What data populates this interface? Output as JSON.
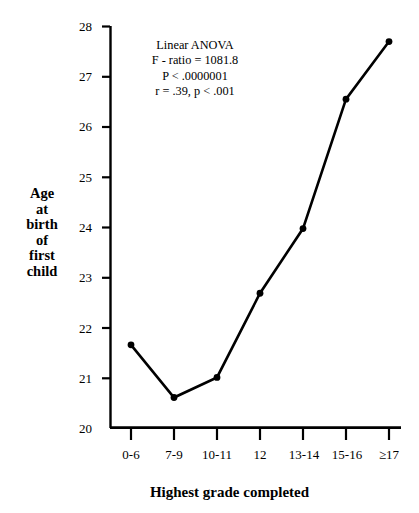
{
  "chart_data": {
    "type": "line",
    "title": "",
    "xlabel": "Highest grade completed",
    "ylabel": "Age at birth of first child",
    "categories": [
      "0-6",
      "7-9",
      "10-11",
      "12",
      "13-14",
      "15-16",
      "≥17"
    ],
    "values": [
      21.65,
      20.6,
      21.0,
      22.68,
      23.97,
      26.55,
      27.7
    ],
    "series": [
      {
        "name": "Age at birth of first child",
        "values": [
          21.65,
          20.6,
          21.0,
          22.68,
          23.97,
          26.55,
          27.7
        ]
      }
    ],
    "ylim": [
      20,
      28
    ],
    "yticks": [
      20,
      21,
      22,
      23,
      24,
      25,
      26,
      27,
      28
    ],
    "ytick_labels": [
      "20",
      "21",
      "22",
      "23",
      "24",
      "25",
      "26",
      "27",
      "28"
    ],
    "grid": false,
    "legend": false,
    "legend_position": "none",
    "marker": "filled-circle",
    "line_color": "#000000",
    "marker_color": "#000000",
    "annotations": [
      "Linear ANOVA",
      "F - ratio = 1081.8",
      "P < .0000001",
      "r = .39, p < .001"
    ]
  },
  "axis_titles": {
    "y_lines": [
      "Age",
      "at",
      "birth",
      "of",
      "first",
      "child"
    ],
    "x": "Highest grade completed"
  },
  "colors": {
    "background": "#ffffff",
    "foreground": "#000000"
  }
}
